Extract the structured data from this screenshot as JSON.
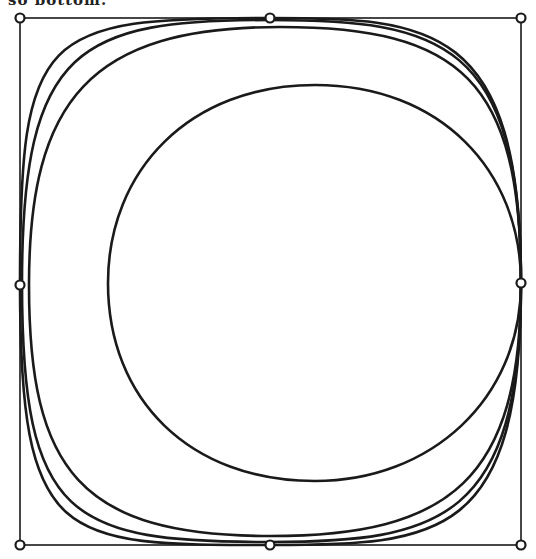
{
  "caption": {
    "text": "so bottom."
  },
  "diagram": {
    "frame": {
      "x": 20,
      "y": 18,
      "width": 501,
      "height": 527
    },
    "control_points": [
      {
        "name": "top-left",
        "x": 20,
        "y": 18
      },
      {
        "name": "top-middle",
        "x": 270,
        "y": 18
      },
      {
        "name": "top-right",
        "x": 521,
        "y": 18
      },
      {
        "name": "left-middle",
        "x": 20,
        "y": 285
      },
      {
        "name": "right-middle",
        "x": 521,
        "y": 283
      },
      {
        "name": "bottom-left",
        "x": 20,
        "y": 545
      },
      {
        "name": "bottom-middle",
        "x": 270,
        "y": 545
      },
      {
        "name": "bottom-right",
        "x": 521,
        "y": 545
      }
    ],
    "curves": [
      {
        "name": "outer-curve-squarest",
        "path": "M270,18 C430,18 521,22 521,283 C521,540 440,545 270,545 C60,545 20,545 20,283 C20,30 40,18 270,18 Z"
      },
      {
        "name": "outer-curve-middle",
        "path": "M270,20 C440,20 521,40 521,283 C521,520 440,542 270,542 C70,542 22,520 22,283 C22,45 80,20 270,20 Z"
      },
      {
        "name": "outer-curve-roundest",
        "path": "M280,27 C460,27 521,80 521,283 C521,480 450,536 270,536 C80,536 29,470 29,285 C29,100 90,27 280,27 Z"
      },
      {
        "name": "inner-circle",
        "path": "M315,85 C440,85 521,170 521,283 C521,400 430,481 315,481 C190,481 108,400 108,283 C108,170 190,85 315,85 Z"
      }
    ]
  }
}
